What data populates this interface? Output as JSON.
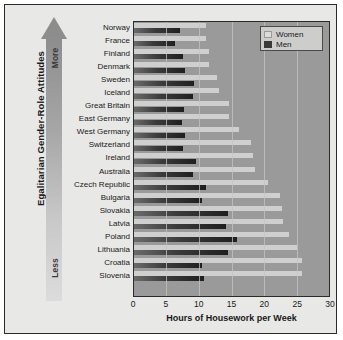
{
  "chart_data": {
    "type": "bar",
    "orientation": "horizontal",
    "title": "",
    "xlabel": "Hours of Housework per Week",
    "ylabel": "Egalitarian Gender-Role Attitudes",
    "xlim": [
      0,
      30
    ],
    "xticks": [
      0,
      5,
      10,
      15,
      20,
      25,
      30
    ],
    "grid": true,
    "legend_position": "top-right",
    "axis_annotations": {
      "top": "More",
      "bottom": "Less"
    },
    "categories": [
      "Norway",
      "France",
      "Finland",
      "Denmark",
      "Sweden",
      "Iceland",
      "Great Britain",
      "East Germany",
      "West Germany",
      "Switzerland",
      "Ireland",
      "Australia",
      "Czech Republic",
      "Bulgaria",
      "Slovakia",
      "Latvia",
      "Poland",
      "Lithuania",
      "Croatia",
      "Slovenia"
    ],
    "series": [
      {
        "name": "Women",
        "color": "#cfcfcf",
        "values": [
          11.0,
          11.0,
          11.5,
          11.6,
          12.8,
          13.0,
          14.6,
          14.6,
          16.2,
          18.0,
          18.3,
          18.6,
          20.6,
          22.4,
          22.8,
          22.9,
          23.8,
          25.0,
          25.8,
          25.9
        ]
      },
      {
        "name": "Men",
        "color": "#2e2e2e",
        "values": [
          7.0,
          6.3,
          7.5,
          7.9,
          9.3,
          9.0,
          7.7,
          7.4,
          7.8,
          7.6,
          9.5,
          9.0,
          11.1,
          10.4,
          14.5,
          14.1,
          15.8,
          14.5,
          10.5,
          10.7
        ]
      }
    ]
  },
  "legend": {
    "items": [
      {
        "label": "Women"
      },
      {
        "label": "Men"
      }
    ]
  }
}
